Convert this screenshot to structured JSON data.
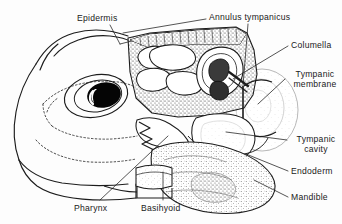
{
  "figure": {
    "background_color": "#fdfdfd",
    "ink_color": "#1a1a1a",
    "width": 342,
    "height": 224
  },
  "labels": {
    "epidermis": "Epidermis",
    "annulus_tympanicus": "Annulus  tympanicus",
    "columella": "Columella",
    "tympanic_membrane": "Tympanic membrane",
    "tympanic_cavity": "Tympanic cavity",
    "endoderm": "Endoderm",
    "mandible": "Mandible",
    "pharynx": "Pharynx",
    "basihyoid": "Basihyoid"
  },
  "structures": [
    {
      "name": "epidermis",
      "label": "Epidermis",
      "side": "top-left",
      "leader": "diagonal down-right to skin edge"
    },
    {
      "name": "annulus-tympanicus",
      "label": "Annulus  tympanicus",
      "side": "top-right",
      "leader": "long sweep left to skull apex"
    },
    {
      "name": "columella",
      "label": "Columella",
      "side": "right",
      "leader": "diagonal down-left to ear ossicle"
    },
    {
      "name": "tympanic-membrane",
      "label": "Tympanic membrane",
      "side": "right",
      "leader": "diagonal down-left to eardrum disc"
    },
    {
      "name": "tympanic-cavity",
      "label": "Tympanic cavity",
      "side": "right",
      "leader": "diagonal up-left into air cavity"
    },
    {
      "name": "endoderm",
      "label": "Endoderm",
      "side": "right",
      "leader": "short diagonal up-left"
    },
    {
      "name": "mandible",
      "label": "Mandible",
      "side": "right",
      "leader": "short diagonal up-left to jaw mass"
    },
    {
      "name": "pharynx",
      "label": "Pharynx",
      "side": "bottom-left",
      "leader": "long diagonal up-right to pharyngeal lumen"
    },
    {
      "name": "basihyoid",
      "label": "Basihyoid",
      "side": "bottom-center",
      "leader": "short vertical up"
    }
  ]
}
